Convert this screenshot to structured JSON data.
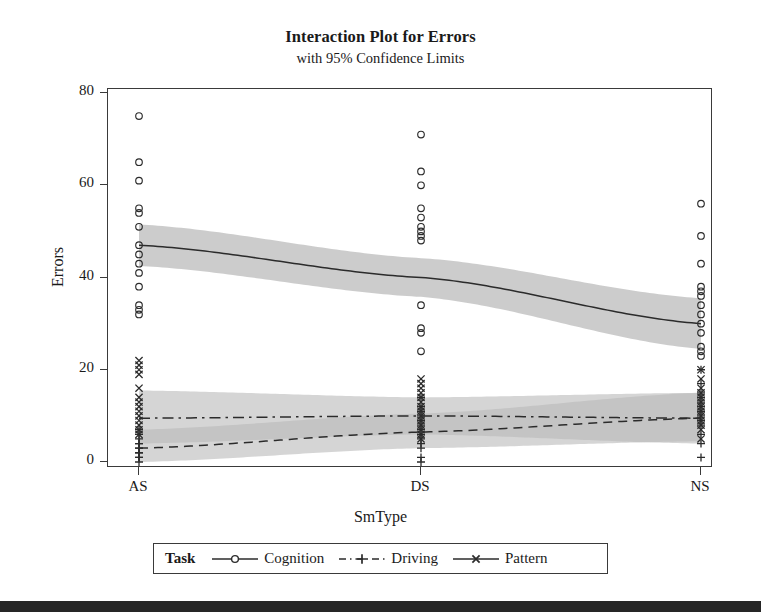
{
  "chart_data": {
    "type": "line",
    "title": "Interaction Plot for Errors",
    "subtitle": "with 95% Confidence Limits",
    "xlabel": "SmType",
    "ylabel": "Errors",
    "categories": [
      "AS",
      "DS",
      "NS"
    ],
    "ylim": [
      0,
      80
    ],
    "yticks": [
      0,
      20,
      40,
      60,
      80
    ],
    "grid": false,
    "legend_position": "bottom",
    "legend_title": "Task",
    "series": [
      {
        "name": "Cognition",
        "marker": "circle",
        "linestyle": "solid",
        "values": [
          47.0,
          40.0,
          30.0
        ],
        "ci_lower": [
          42.5,
          35.8,
          24.5
        ],
        "ci_upper": [
          51.5,
          44.2,
          35.5
        ],
        "points": {
          "AS": [
            75,
            65,
            61,
            55,
            54,
            51,
            47,
            45,
            43,
            41,
            38,
            34,
            33,
            32
          ],
          "DS": [
            71,
            63,
            60,
            55,
            53,
            51,
            50,
            49,
            48,
            34,
            29,
            28,
            24
          ],
          "NS": [
            56,
            49,
            43,
            38,
            37,
            36,
            34,
            32,
            30,
            28,
            25,
            24,
            23
          ]
        }
      },
      {
        "name": "Driving",
        "marker": "plus",
        "linestyle": "dashed",
        "values": [
          3.0,
          6.5,
          9.5
        ],
        "ci_lower": [
          0.0,
          3.0,
          4.5
        ],
        "ci_upper": [
          7.0,
          10.5,
          15.0
        ],
        "points": {
          "AS": [
            7,
            6,
            5,
            4,
            4,
            3,
            3,
            2,
            2,
            1,
            1,
            0
          ],
          "DS": [
            14,
            12,
            11,
            10,
            9,
            8,
            7,
            6,
            5,
            4,
            3,
            1,
            0
          ],
          "NS": [
            20,
            17,
            15,
            14,
            13,
            12,
            11,
            10,
            9,
            8,
            6,
            4,
            1
          ]
        }
      },
      {
        "name": "Pattern",
        "marker": "cross",
        "linestyle": "dashdot",
        "values": [
          9.5,
          10.0,
          9.5
        ],
        "ci_lower": [
          4.0,
          6.0,
          4.0
        ],
        "ci_upper": [
          15.5,
          14.0,
          15.0
        ],
        "points": {
          "AS": [
            22,
            21,
            20,
            19,
            16,
            14,
            13,
            12,
            11,
            10,
            9,
            8,
            7,
            6
          ],
          "DS": [
            18,
            17,
            16,
            15,
            14,
            13,
            12,
            11,
            10,
            9,
            8,
            7,
            6,
            5
          ],
          "NS": [
            20,
            18,
            16,
            15,
            14,
            13,
            12,
            11,
            10,
            9,
            8,
            7,
            5
          ]
        }
      }
    ]
  },
  "legend": {
    "title": "Task",
    "entries": [
      {
        "label": "Cognition"
      },
      {
        "label": "Driving"
      },
      {
        "label": "Pattern"
      }
    ]
  },
  "axis": {
    "y_tick_labels": [
      "80",
      "60",
      "40",
      "20",
      "0"
    ],
    "x_tick_labels": [
      "AS",
      "DS",
      "NS"
    ]
  },
  "colors": {
    "line": "#2b2b2b",
    "frame": "#3a3a3a",
    "band_light": "#b9b9b9",
    "band_dark": "#8f8f8f",
    "text": "#1a1a1a",
    "scanbar": "#262626"
  }
}
